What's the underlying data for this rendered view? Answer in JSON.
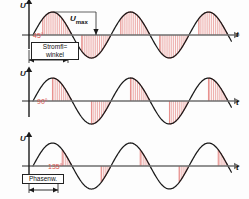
{
  "figure": {
    "caption": "Phasenanschnittsteuerung - Stromflusswinkel",
    "axis_u": "U",
    "axis_t": "t",
    "umax_label": "U",
    "umax_sub": "max"
  },
  "colors": {
    "hatch": "#e8918e",
    "hatch_light": "#f0b6b4",
    "curve": "#1a1a1a",
    "axis": "#6e6e6e",
    "angle_text": "#d9534f",
    "background": "#fdfdfd"
  },
  "panels": [
    {
      "id": "panel-45",
      "axis_u": "U",
      "axis_t": "t",
      "angle": "45°",
      "box_line1": "Stromfl=",
      "box_line2": "winkel",
      "has_umax": true,
      "has_dimension": true,
      "firing_angle_deg": 45,
      "conduction_fraction": 0.75
    },
    {
      "id": "panel-90",
      "axis_u": "U",
      "axis_t": "t",
      "angle": "90°",
      "has_umax": false,
      "has_dimension": false,
      "firing_angle_deg": 90,
      "conduction_fraction": 0.5
    },
    {
      "id": "panel-135",
      "axis_u": "U",
      "axis_t": "t",
      "angle": "135°",
      "box_line1": "Phasenw.",
      "has_umax": false,
      "has_dimension": true,
      "firing_angle_deg": 135,
      "conduction_fraction": 0.25
    }
  ],
  "chart_data": {
    "type": "line",
    "xlabel": "t",
    "ylabel": "U",
    "grid": false,
    "legend": null,
    "x": [
      0,
      360,
      720,
      1080
    ],
    "series": [
      {
        "name": "45° Stromflusswinkel",
        "waveform": "sine",
        "amplitude": 1,
        "periods": 2.6,
        "shaded_from_deg": 45,
        "annotation": "45°"
      },
      {
        "name": "90° Stromflusswinkel",
        "waveform": "sine",
        "amplitude": 1,
        "periods": 2.6,
        "shaded_from_deg": 90,
        "annotation": "90°"
      },
      {
        "name": "135° Stromflusswinkel",
        "waveform": "sine",
        "amplitude": 1,
        "periods": 2.6,
        "shaded_from_deg": 135,
        "annotation": "135°"
      }
    ],
    "annotations": [
      "U_max",
      "Stromfl= winkel",
      "Phasenw."
    ]
  }
}
